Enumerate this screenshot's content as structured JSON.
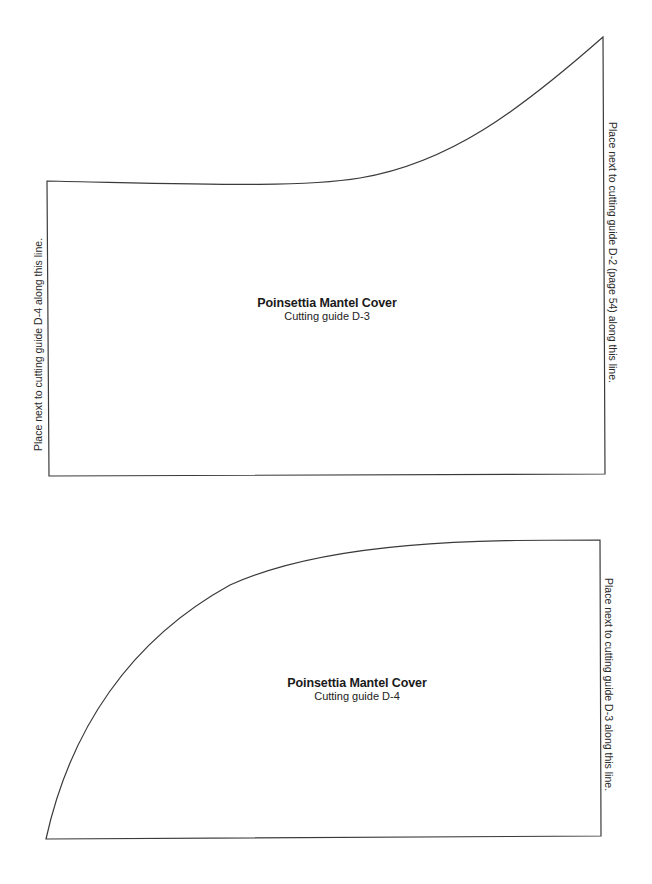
{
  "pieces": [
    {
      "id": "D-3",
      "title": "Poinsettia Mantel Cover",
      "subtitle": "Cutting guide D-3",
      "left_edge_label": "Place next  to cutting guide D-4 along this line.",
      "right_edge_label": "Place next to cutting guide D-2 (page 54) along this line."
    },
    {
      "id": "D-4",
      "title": "Poinsettia Mantel Cover",
      "subtitle": "Cutting guide D-4",
      "right_edge_label": "Place next to cutting guide D-3 along this line."
    }
  ],
  "colors": {
    "outline": "#3a3a3a",
    "text": "#1a1a1a",
    "background": "#ffffff"
  }
}
